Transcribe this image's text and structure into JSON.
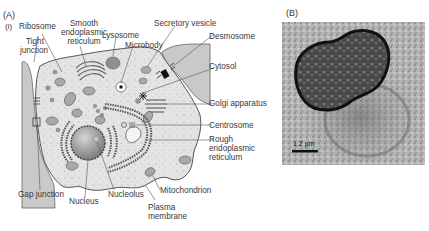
{
  "panels": {
    "a_label": "(A)",
    "a_sub_label": "(i)",
    "b_label": "(B)"
  },
  "labels": {
    "ribosome": "Ribosome",
    "smooth_er_1": "Smooth",
    "smooth_er_2": "endoplasmic",
    "smooth_er_3": "reticulum",
    "tight_junction_1": "Tight",
    "tight_junction_2": "junction",
    "lysosome": "Lysosome",
    "microbody": "Microbody",
    "secretory_vesicle": "Secretory vesicle",
    "desmosome": "Desmosome",
    "cytosol": "Cytosol",
    "golgi": "Golgi apparatus",
    "centrosome": "Centrosome",
    "rough_er_1": "Rough",
    "rough_er_2": "endoplasmic",
    "rough_er_3": "reticulum",
    "gap_junction": "Gap junction",
    "nucleus": "Nucleus",
    "nucleolus": "Nucleolus",
    "mitochondrion": "Mitochondrion",
    "plasma_membrane_1": "Plasma",
    "plasma_membrane_2": "membrane"
  },
  "micrograph": {
    "scale_bar_label": "1.2 µm"
  },
  "colors": {
    "cell_fill": "#e4e4e4",
    "neighbor_fill": "#c9c9c9",
    "outline": "#555555",
    "organelle": "#a8a8a8",
    "nucleus": "#9a9a9a"
  }
}
